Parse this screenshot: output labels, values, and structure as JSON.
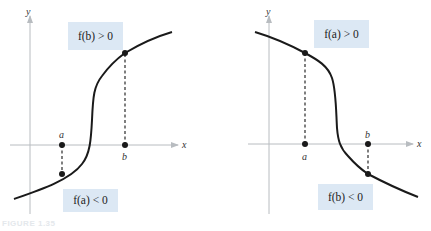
{
  "figure": {
    "caption": "FIGURE 1.35",
    "colors": {
      "label_box": "#dce8f4",
      "curve": "#1a1a1a",
      "axis": "#b8bcc0"
    }
  },
  "left_panel": {
    "y_axis_label": "y",
    "x_axis_label": "x",
    "point_a_label": "a",
    "point_b_label": "b",
    "top_box": "f(b) > 0",
    "bottom_box": "f(a) < 0",
    "description": "Increasing S-shaped curve crossing x-axis between a and b"
  },
  "right_panel": {
    "y_axis_label": "y",
    "x_axis_label": "x",
    "point_a_label": "a",
    "point_b_label": "b",
    "top_box": "f(a) > 0",
    "bottom_box": "f(b) < 0",
    "description": "Decreasing S-shaped curve crossing x-axis between a and b"
  }
}
